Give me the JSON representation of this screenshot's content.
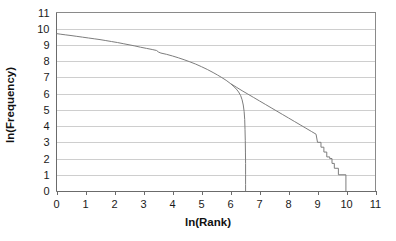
{
  "chart_data": {
    "type": "line",
    "title": "",
    "subtitle": "",
    "xlabel": "ln(Rank)",
    "ylabel": "ln(Frequency)",
    "xlim": [
      0,
      11
    ],
    "ylim": [
      0,
      11
    ],
    "xticks": [
      0,
      1,
      2,
      3,
      4,
      5,
      6,
      7,
      8,
      9,
      10,
      11
    ],
    "yticks": [
      0,
      1,
      2,
      3,
      4,
      5,
      6,
      7,
      8,
      9,
      10,
      11
    ],
    "xtick_labels": [
      "0",
      "1",
      "2",
      "3",
      "4",
      "5",
      "6",
      "7",
      "8",
      "9",
      "10",
      "11"
    ],
    "ytick_labels": [
      "0",
      "1",
      "2",
      "3",
      "4",
      "5",
      "6",
      "7",
      "8",
      "9",
      "10",
      "11"
    ],
    "grid": "horizontal",
    "legend": "none",
    "legend_position": "none",
    "series": [
      {
        "name": "truncated-distribution",
        "comment": "Upper Zipf-like curve that bends down and drops steeply near ln(Rank) 6.5",
        "points": [
          [
            0.0,
            9.7
          ],
          [
            0.15,
            9.66
          ],
          [
            0.32,
            9.62
          ],
          [
            0.5,
            9.58
          ],
          [
            0.7,
            9.53
          ],
          [
            0.9,
            9.48
          ],
          [
            1.1,
            9.43
          ],
          [
            1.3,
            9.38
          ],
          [
            1.5,
            9.33
          ],
          [
            1.7,
            9.27
          ],
          [
            1.9,
            9.21
          ],
          [
            2.1,
            9.15
          ],
          [
            2.3,
            9.08
          ],
          [
            2.5,
            9.01
          ],
          [
            2.7,
            8.94
          ],
          [
            2.9,
            8.86
          ],
          [
            3.1,
            8.79
          ],
          [
            3.3,
            8.72
          ],
          [
            3.45,
            8.66
          ],
          [
            3.52,
            8.56
          ],
          [
            3.6,
            8.5
          ],
          [
            3.8,
            8.42
          ],
          [
            4.0,
            8.32
          ],
          [
            4.2,
            8.21
          ],
          [
            4.4,
            8.09
          ],
          [
            4.6,
            7.96
          ],
          [
            4.8,
            7.82
          ],
          [
            5.0,
            7.66
          ],
          [
            5.2,
            7.49
          ],
          [
            5.4,
            7.3
          ],
          [
            5.55,
            7.15
          ],
          [
            5.7,
            6.99
          ],
          [
            5.85,
            6.82
          ],
          [
            6.0,
            6.62
          ],
          [
            6.1,
            6.46
          ],
          [
            6.2,
            6.28
          ],
          [
            6.28,
            6.1
          ],
          [
            6.35,
            5.88
          ],
          [
            6.4,
            5.62
          ],
          [
            6.44,
            5.3
          ],
          [
            6.47,
            4.9
          ],
          [
            6.49,
            4.4
          ],
          [
            6.5,
            3.8
          ],
          [
            6.51,
            3.1
          ],
          [
            6.515,
            2.4
          ],
          [
            6.52,
            1.7
          ],
          [
            6.52,
            1.0
          ],
          [
            6.52,
            0.4
          ],
          [
            6.52,
            0.0
          ]
        ]
      },
      {
        "name": "full-distribution",
        "comment": "Lower-tail continuation extending to ln(Rank) 10 with integer-count staircase at the tail",
        "points": [
          [
            6.0,
            6.62
          ],
          [
            6.2,
            6.4
          ],
          [
            6.4,
            6.18
          ],
          [
            6.6,
            5.97
          ],
          [
            6.8,
            5.76
          ],
          [
            7.0,
            5.55
          ],
          [
            7.2,
            5.34
          ],
          [
            7.4,
            5.13
          ],
          [
            7.6,
            4.92
          ],
          [
            7.8,
            4.71
          ],
          [
            8.0,
            4.5
          ],
          [
            8.2,
            4.29
          ],
          [
            8.4,
            4.08
          ],
          [
            8.6,
            3.87
          ],
          [
            8.8,
            3.66
          ],
          [
            8.95,
            3.5
          ],
          [
            9.0,
            3.0
          ],
          [
            9.12,
            3.0
          ],
          [
            9.12,
            2.7
          ],
          [
            9.22,
            2.7
          ],
          [
            9.22,
            2.4
          ],
          [
            9.32,
            2.4
          ],
          [
            9.32,
            2.1
          ],
          [
            9.42,
            2.1
          ],
          [
            9.42,
            2.0
          ],
          [
            9.5,
            2.0
          ],
          [
            9.5,
            1.7
          ],
          [
            9.58,
            1.7
          ],
          [
            9.58,
            1.4
          ],
          [
            9.72,
            1.4
          ],
          [
            9.72,
            1.0
          ],
          [
            9.98,
            1.0
          ],
          [
            9.98,
            0.0
          ]
        ]
      }
    ]
  },
  "axes": {
    "y_axis_title": "ln(Frequency)",
    "x_axis_title": "ln(Rank)"
  }
}
